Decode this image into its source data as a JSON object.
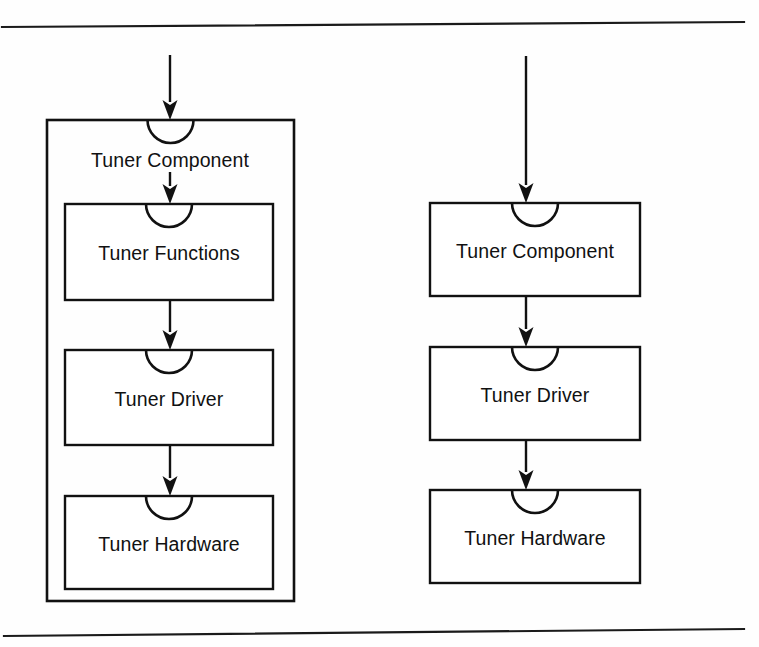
{
  "page": {
    "width": 759,
    "height": 647,
    "background": "#fefefe",
    "ink_color": "#111111"
  },
  "rules": {
    "top": {
      "name": "top-horizontal-rule",
      "x1": 2,
      "y1": 27,
      "x2": 744,
      "y2": 22
    },
    "bottom": {
      "name": "bottom-horizontal-rule",
      "x1": 4,
      "y1": 636,
      "x2": 744,
      "y2": 629
    }
  },
  "diagram": {
    "type": "component-layering-diagram",
    "notation": "UML component boxes with required-interface socket notches and downward flow arrows",
    "variants": [
      {
        "id": "nested-variant",
        "name": "left-diagram",
        "description": "Tuner Component drawn as an outer container enclosing its internal layers",
        "container": {
          "label": "Tuner Component",
          "x": 47,
          "y": 120,
          "width": 247,
          "height": 481,
          "socket": true,
          "label_x": 170,
          "label_y": 167
        },
        "entry_arrow": {
          "x": 170,
          "y1": 55,
          "y2": 120
        },
        "inner_arrows": [
          {
            "from": "Tuner Component",
            "to": "Tuner Functions",
            "x": 170,
            "y1": 172,
            "y2": 204
          },
          {
            "from": "Tuner Functions",
            "to": "Tuner Driver",
            "x": 170,
            "y1": 300,
            "y2": 350
          },
          {
            "from": "Tuner Driver",
            "to": "Tuner Hardware",
            "x": 170,
            "y1": 445,
            "y2": 496
          }
        ],
        "boxes": [
          {
            "label": "Tuner Functions",
            "x": 65,
            "y": 204,
            "width": 208,
            "height": 96,
            "socket": true
          },
          {
            "label": "Tuner Driver",
            "x": 65,
            "y": 350,
            "width": 208,
            "height": 95,
            "socket": true
          },
          {
            "label": "Tuner Hardware",
            "x": 65,
            "y": 496,
            "width": 208,
            "height": 93,
            "socket": true
          }
        ]
      },
      {
        "id": "flat-variant",
        "name": "right-diagram",
        "description": "Tuner Component drawn as a peer layer in a flat stack",
        "container": null,
        "entry_arrow": {
          "x": 526,
          "y1": 56,
          "y2": 203
        },
        "inner_arrows": [
          {
            "from": "Tuner Component",
            "to": "Tuner Driver",
            "x": 526,
            "y1": 296,
            "y2": 347
          },
          {
            "from": "Tuner Driver",
            "to": "Tuner Hardware",
            "x": 526,
            "y1": 440,
            "y2": 490
          }
        ],
        "boxes": [
          {
            "label": "Tuner Component",
            "x": 430,
            "y": 203,
            "width": 210,
            "height": 93,
            "socket": true
          },
          {
            "label": "Tuner Driver",
            "x": 430,
            "y": 347,
            "width": 210,
            "height": 93,
            "socket": true
          },
          {
            "label": "Tuner Hardware",
            "x": 430,
            "y": 490,
            "width": 210,
            "height": 93,
            "socket": true
          }
        ]
      }
    ]
  }
}
